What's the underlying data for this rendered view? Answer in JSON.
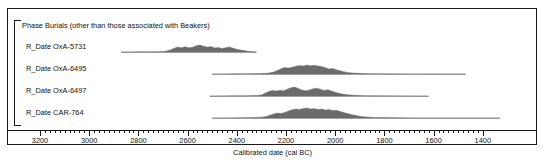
{
  "chart_data": {
    "type": "area",
    "title": "Phase Burials (other than those associated with Beakers)",
    "xlabel": "Calibrated date (cal BC)",
    "ylabel": "",
    "xlim": [
      3300,
      1400
    ],
    "x_direction": "decreasing",
    "grid": false,
    "legend": "none",
    "major_ticks": [
      3200,
      3000,
      2800,
      2600,
      2400,
      2200,
      2000,
      1800,
      1600,
      1400
    ],
    "minor_tick_interval": 20,
    "fill_color": "#6b6b6b",
    "axis_color": "#1a1a1a",
    "series": [
      {
        "name": "R_Date OxA-5731",
        "range_start": 2870,
        "range_end": 2320,
        "points": [
          [
            2870,
            0.0
          ],
          [
            2840,
            0.01
          ],
          [
            2800,
            0.02
          ],
          [
            2760,
            0.03
          ],
          [
            2720,
            0.04
          ],
          [
            2690,
            0.1
          ],
          [
            2670,
            0.3
          ],
          [
            2655,
            0.55
          ],
          [
            2640,
            0.72
          ],
          [
            2625,
            0.62
          ],
          [
            2610,
            0.74
          ],
          [
            2595,
            0.6
          ],
          [
            2580,
            0.68
          ],
          [
            2565,
            0.88
          ],
          [
            2550,
            1.0
          ],
          [
            2535,
            0.82
          ],
          [
            2520,
            0.7
          ],
          [
            2505,
            0.78
          ],
          [
            2490,
            0.58
          ],
          [
            2475,
            0.64
          ],
          [
            2460,
            0.5
          ],
          [
            2445,
            0.62
          ],
          [
            2430,
            0.72
          ],
          [
            2415,
            0.55
          ],
          [
            2400,
            0.4
          ],
          [
            2385,
            0.3
          ],
          [
            2370,
            0.2
          ],
          [
            2355,
            0.12
          ],
          [
            2340,
            0.06
          ],
          [
            2325,
            0.02
          ],
          [
            2320,
            0.0
          ]
        ]
      },
      {
        "name": "R_Date OxA-6495",
        "range_start": 2500,
        "range_end": 1470,
        "points": [
          [
            2500,
            0.0
          ],
          [
            2450,
            0.01
          ],
          [
            2400,
            0.02
          ],
          [
            2350,
            0.03
          ],
          [
            2300,
            0.05
          ],
          [
            2270,
            0.1
          ],
          [
            2250,
            0.22
          ],
          [
            2235,
            0.4
          ],
          [
            2220,
            0.58
          ],
          [
            2205,
            0.72
          ],
          [
            2190,
            0.66
          ],
          [
            2175,
            0.74
          ],
          [
            2160,
            0.86
          ],
          [
            2145,
            0.95
          ],
          [
            2130,
            0.88
          ],
          [
            2115,
            1.0
          ],
          [
            2100,
            0.92
          ],
          [
            2085,
            0.96
          ],
          [
            2070,
            0.9
          ],
          [
            2055,
            0.82
          ],
          [
            2040,
            0.7
          ],
          [
            2025,
            0.56
          ],
          [
            2010,
            0.6
          ],
          [
            1995,
            0.48
          ],
          [
            1980,
            0.36
          ],
          [
            1965,
            0.26
          ],
          [
            1950,
            0.18
          ],
          [
            1930,
            0.12
          ],
          [
            1900,
            0.07
          ],
          [
            1860,
            0.04
          ],
          [
            1800,
            0.02
          ],
          [
            1700,
            0.01
          ],
          [
            1560,
            0.0
          ],
          [
            1470,
            0.0
          ]
        ]
      },
      {
        "name": "R_Date OxA-6497",
        "range_start": 2510,
        "range_end": 1620,
        "points": [
          [
            2510,
            0.0
          ],
          [
            2460,
            0.01
          ],
          [
            2410,
            0.02
          ],
          [
            2360,
            0.03
          ],
          [
            2320,
            0.05
          ],
          [
            2300,
            0.12
          ],
          [
            2285,
            0.3
          ],
          [
            2270,
            0.5
          ],
          [
            2255,
            0.62
          ],
          [
            2240,
            0.56
          ],
          [
            2225,
            0.64
          ],
          [
            2210,
            0.58
          ],
          [
            2195,
            0.76
          ],
          [
            2180,
            0.92
          ],
          [
            2165,
            1.0
          ],
          [
            2150,
            0.84
          ],
          [
            2135,
            0.66
          ],
          [
            2120,
            0.58
          ],
          [
            2105,
            0.68
          ],
          [
            2090,
            0.8
          ],
          [
            2075,
            0.86
          ],
          [
            2060,
            0.76
          ],
          [
            2045,
            0.62
          ],
          [
            2030,
            0.7
          ],
          [
            2015,
            0.56
          ],
          [
            2000,
            0.42
          ],
          [
            1985,
            0.3
          ],
          [
            1970,
            0.22
          ],
          [
            1950,
            0.14
          ],
          [
            1920,
            0.08
          ],
          [
            1880,
            0.04
          ],
          [
            1820,
            0.02
          ],
          [
            1720,
            0.01
          ],
          [
            1620,
            0.0
          ]
        ]
      },
      {
        "name": "R_Date CAR-764",
        "range_start": 2500,
        "range_end": 1330,
        "points": [
          [
            2500,
            0.0
          ],
          [
            2440,
            0.01
          ],
          [
            2380,
            0.02
          ],
          [
            2330,
            0.04
          ],
          [
            2300,
            0.08
          ],
          [
            2280,
            0.16
          ],
          [
            2265,
            0.28
          ],
          [
            2250,
            0.4
          ],
          [
            2235,
            0.5
          ],
          [
            2220,
            0.46
          ],
          [
            2205,
            0.56
          ],
          [
            2190,
            0.7
          ],
          [
            2175,
            0.82
          ],
          [
            2160,
            0.9
          ],
          [
            2145,
            0.84
          ],
          [
            2130,
            0.94
          ],
          [
            2115,
            1.0
          ],
          [
            2100,
            0.9
          ],
          [
            2085,
            0.94
          ],
          [
            2070,
            0.86
          ],
          [
            2055,
            0.9
          ],
          [
            2040,
            0.8
          ],
          [
            2025,
            0.84
          ],
          [
            2010,
            0.74
          ],
          [
            1995,
            0.78
          ],
          [
            1980,
            0.66
          ],
          [
            1965,
            0.54
          ],
          [
            1950,
            0.44
          ],
          [
            1935,
            0.34
          ],
          [
            1915,
            0.24
          ],
          [
            1895,
            0.16
          ],
          [
            1870,
            0.1
          ],
          [
            1840,
            0.06
          ],
          [
            1800,
            0.04
          ],
          [
            1750,
            0.02
          ],
          [
            1680,
            0.01
          ],
          [
            1540,
            0.0
          ],
          [
            1330,
            0.0
          ]
        ]
      }
    ]
  },
  "phase": {
    "title": "Phase Burials (other than those associated with Beakers)"
  },
  "rows": [
    {
      "label": "R_Date OxA-5731"
    },
    {
      "label": "R_Date OxA-6495"
    },
    {
      "label": "R_Date OxA-6497"
    },
    {
      "label": "R_Date CAR-764"
    }
  ],
  "axis": {
    "title": "Calibrated date (cal BC)",
    "labels": [
      "3200",
      "3000",
      "2800",
      "2600",
      "2400",
      "2200",
      "2000",
      "1800",
      "1600",
      "1400"
    ]
  }
}
